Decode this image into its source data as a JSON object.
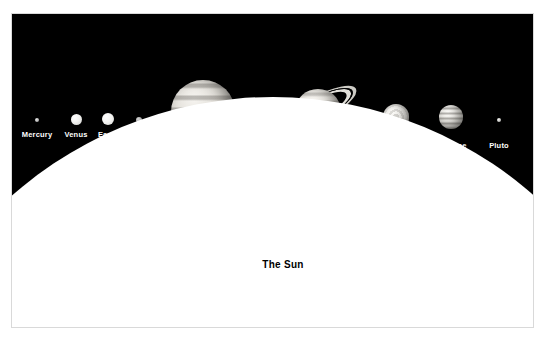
{
  "diagram": {
    "background_color": "#000000",
    "page_background": "#ffffff",
    "frame_color": "#d9d9d9",
    "label_color": "#ffffff",
    "sun_label_color": "#000000"
  },
  "sun": {
    "label": "The Sun",
    "color": "#ffffff"
  },
  "planets": [
    {
      "name": "mercury",
      "label": "Mercury",
      "x": 36,
      "y": 119,
      "diameter": 4,
      "label_x": 36,
      "label_y": 129
    },
    {
      "name": "venus",
      "label": "Venus",
      "x": 75,
      "y": 118,
      "diameter": 11,
      "label_x": 75,
      "label_y": 129
    },
    {
      "name": "earth",
      "label": "Earth",
      "x": 107,
      "y": 118,
      "diameter": 12,
      "label_x": 107,
      "label_y": 129
    },
    {
      "name": "mars",
      "label": "Mars",
      "x": 138,
      "y": 119,
      "diameter": 6,
      "label_x": 138,
      "label_y": 129
    },
    {
      "name": "jupiter",
      "label": "Jupiter",
      "x": 202,
      "y": 111,
      "diameter": 64,
      "label_x": 202,
      "label_y": 167
    },
    {
      "name": "saturn",
      "label": "Saturn",
      "x": 317,
      "y": 108,
      "diameter": 44,
      "ring_span": 86,
      "ring_tilt_deg": -28,
      "label_x": 315,
      "label_y": 167
    },
    {
      "name": "uranus",
      "label": "Uranus",
      "x": 395,
      "y": 116,
      "diameter": 26,
      "label_x": 395,
      "label_y": 140
    },
    {
      "name": "neptune",
      "label": "Neptune",
      "x": 450,
      "y": 116,
      "diameter": 24,
      "label_x": 450,
      "label_y": 140
    },
    {
      "name": "pluto",
      "label": "Pluto",
      "x": 498,
      "y": 119,
      "diameter": 4,
      "label_x": 498,
      "label_y": 140
    }
  ]
}
